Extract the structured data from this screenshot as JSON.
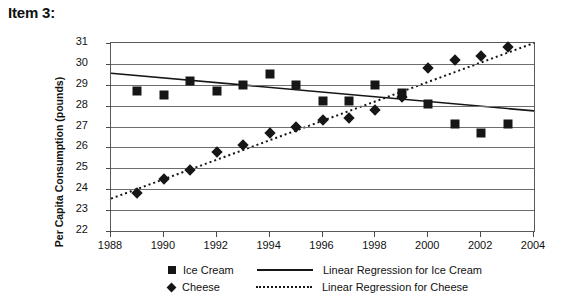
{
  "item_label": "Item 3:",
  "chart_data": {
    "type": "scatter",
    "title": "",
    "xlabel": "",
    "ylabel": "Per Capita Consumption (pounds)",
    "xlim": [
      1988,
      2004
    ],
    "ylim": [
      22,
      31
    ],
    "xticks": [
      1988,
      1990,
      1992,
      1994,
      1996,
      1998,
      2000,
      2002,
      2004
    ],
    "yticks": [
      22,
      23,
      24,
      25,
      26,
      27,
      28,
      29,
      30,
      31
    ],
    "grid": "horizontal",
    "legend_position": "bottom",
    "x": [
      1989,
      1990,
      1991,
      1992,
      1993,
      1994,
      1995,
      1996,
      1997,
      1998,
      1999,
      2000,
      2001,
      2002,
      2003
    ],
    "series": [
      {
        "name": "Ice Cream",
        "marker": "square",
        "values": [
          28.7,
          28.5,
          29.2,
          28.7,
          29.0,
          29.5,
          29.0,
          28.2,
          28.2,
          29.0,
          28.6,
          28.1,
          27.1,
          26.7,
          27.1
        ]
      },
      {
        "name": "Cheese",
        "marker": "diamond",
        "values": [
          23.8,
          24.5,
          24.9,
          25.8,
          26.1,
          26.7,
          27.0,
          27.3,
          27.4,
          27.8,
          28.4,
          29.8,
          30.2,
          30.4,
          30.8
        ]
      }
    ],
    "trendlines": [
      {
        "name": "Linear Regression for Ice Cream",
        "style": "solid",
        "x0": 1988,
        "y0": 29.55,
        "x1": 2004,
        "y1": 27.75
      },
      {
        "name": "Linear Regression for Cheese",
        "style": "dotted",
        "x0": 1988,
        "y0": 23.55,
        "x1": 2004,
        "y1": 31.0
      }
    ],
    "legend": [
      {
        "label": "Ice Cream",
        "marker": "square",
        "line_label": "Linear Regression for Ice Cream",
        "line_style": "solid"
      },
      {
        "label": "Cheese",
        "marker": "diamond",
        "line_label": "Linear Regression for Cheese",
        "line_style": "dotted"
      }
    ]
  },
  "colors": {
    "marker": "#161616",
    "grid": "#6e6e6e",
    "frame": "#5a5a5a",
    "text": "#111111",
    "background": "#ffffff"
  }
}
